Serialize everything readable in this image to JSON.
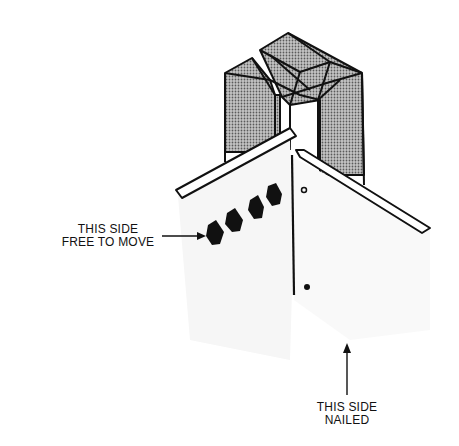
{
  "diagram": {
    "labels": {
      "free_side_line1": "THIS SIDE",
      "free_side_line2": "FREE TO MOVE",
      "nailed_side_line1": "THIS SIDE",
      "nailed_side_line2": "NAILED"
    },
    "colors": {
      "ink": "#111111",
      "stud_fill": "#9a9a9a",
      "panel_fill": "#f7f7f7",
      "background": "#ffffff"
    }
  }
}
